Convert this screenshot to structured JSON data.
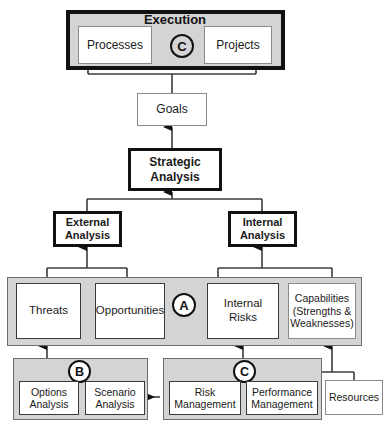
{
  "diagram": {
    "colors": {
      "panel_fill": "#d4d4d4",
      "node_fill": "#ffffff",
      "stroke": "#111111",
      "thin_stroke": "#8a8a8a"
    },
    "groups": {
      "execution": {
        "label": "Execution",
        "marker": "C"
      },
      "analysis_panel": {
        "marker": "A"
      },
      "options_panel": {
        "marker": "B"
      },
      "management_panel": {
        "marker": "C"
      }
    },
    "nodes": {
      "processes": {
        "label": "Processes"
      },
      "projects": {
        "label": "Projects"
      },
      "goals": {
        "label": "Goals"
      },
      "strategic_analysis": {
        "line1": "Strategic",
        "line2": "Analysis"
      },
      "external_analysis": {
        "line1": "External",
        "line2": "Analysis"
      },
      "internal_analysis": {
        "line1": "Internal",
        "line2": "Analysis"
      },
      "threats": {
        "label": "Threats"
      },
      "opportunities": {
        "label": "Opportunities"
      },
      "internal_risks": {
        "line1": "Internal",
        "line2": "Risks"
      },
      "capabilities": {
        "line1": "Capabilities",
        "line2": "(Strengths &",
        "line3": "Weaknesses)"
      },
      "options_analysis": {
        "line1": "Options",
        "line2": "Analysis"
      },
      "scenario_analysis": {
        "line1": "Scenario",
        "line2": "Analysis"
      },
      "risk_management": {
        "line1": "Risk",
        "line2": "Management"
      },
      "performance_management": {
        "line1": "Performance",
        "line2": "Management"
      },
      "resources": {
        "label": "Resources"
      }
    }
  }
}
